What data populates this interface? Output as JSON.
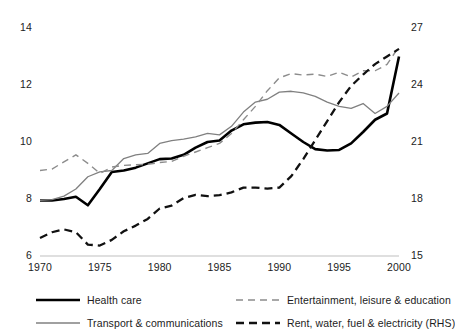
{
  "chart_data": {
    "type": "line",
    "title": "",
    "subtitle": "",
    "xlabel": "",
    "ylabel": "",
    "grid": false,
    "legend_position": "bottom",
    "x": [
      1970,
      1971,
      1972,
      1973,
      1974,
      1975,
      1976,
      1977,
      1978,
      1979,
      1980,
      1981,
      1982,
      1983,
      1984,
      1985,
      1986,
      1987,
      1988,
      1989,
      1990,
      1991,
      1992,
      1993,
      1994,
      1995,
      1996,
      1997,
      1998,
      1999,
      2000
    ],
    "xlim": [
      1970,
      2000
    ],
    "xticks": [
      1970,
      1975,
      1980,
      1985,
      1990,
      1995,
      2000
    ],
    "xtick_labels": [
      "1970",
      "1975",
      "1980",
      "1985",
      "1990",
      "1995",
      "2000"
    ],
    "axes": [
      {
        "id": "left",
        "position": "left",
        "ylim": [
          6,
          14
        ],
        "yticks": [
          6,
          8,
          10,
          12,
          14
        ],
        "ytick_labels": [
          "6",
          "8",
          "10",
          "12",
          "14"
        ]
      },
      {
        "id": "right",
        "position": "right",
        "ylim": [
          15,
          27
        ],
        "yticks": [
          15,
          18,
          21,
          24,
          27
        ],
        "ytick_labels": [
          "15",
          "18",
          "21",
          "24",
          "27"
        ]
      }
    ],
    "series": [
      {
        "name": "Health care",
        "legend_label": "Health care",
        "axis": "left",
        "style": "solid",
        "color": "#000000",
        "width": 2.6,
        "values": [
          7.95,
          7.95,
          8.0,
          8.08,
          7.78,
          8.35,
          8.95,
          9.0,
          9.1,
          9.25,
          9.4,
          9.42,
          9.55,
          9.8,
          10.0,
          10.05,
          10.4,
          10.62,
          10.68,
          10.7,
          10.6,
          10.3,
          10.0,
          9.75,
          9.7,
          9.72,
          9.95,
          10.35,
          10.78,
          11.0,
          13.0
        ]
      },
      {
        "name": "Transport & communications",
        "legend_label": "Transport & communications",
        "axis": "left",
        "style": "solid",
        "color": "#808080",
        "width": 1.3,
        "values": [
          7.95,
          7.98,
          8.1,
          8.35,
          8.78,
          8.95,
          9.0,
          9.42,
          9.55,
          9.6,
          9.95,
          10.05,
          10.1,
          10.18,
          10.3,
          10.25,
          10.55,
          11.05,
          11.4,
          11.5,
          11.75,
          11.78,
          11.72,
          11.6,
          11.4,
          11.25,
          11.18,
          11.35,
          11.0,
          11.25,
          11.72
        ]
      },
      {
        "name": "Entertainment, leisure & education",
        "legend_label": "Entertainment, leisure & education",
        "axis": "left",
        "style": "dashed-light",
        "color": "#8c8c8c",
        "width": 1.4,
        "values": [
          9.0,
          9.05,
          9.3,
          9.55,
          9.25,
          8.9,
          9.12,
          9.18,
          9.2,
          9.22,
          9.28,
          9.32,
          9.5,
          9.65,
          9.8,
          9.95,
          10.3,
          10.78,
          11.25,
          11.8,
          12.25,
          12.4,
          12.35,
          12.38,
          12.3,
          12.45,
          12.28,
          12.5,
          12.5,
          12.72,
          13.35
        ]
      },
      {
        "name": "Rent, water, fuel & electricity (RHS)",
        "legend_label": "Rent, water, fuel & electricity (RHS)",
        "axis": "right",
        "style": "dashed-heavy",
        "color": "#111111",
        "width": 2.3,
        "values": [
          15.95,
          16.25,
          16.4,
          16.25,
          15.6,
          15.55,
          15.85,
          16.3,
          16.6,
          16.95,
          17.5,
          17.65,
          18.05,
          18.22,
          18.15,
          18.2,
          18.35,
          18.6,
          18.6,
          18.55,
          18.6,
          19.2,
          20.1,
          21.1,
          22.1,
          23.1,
          23.95,
          24.55,
          25.1,
          25.5,
          25.9
        ]
      }
    ]
  }
}
